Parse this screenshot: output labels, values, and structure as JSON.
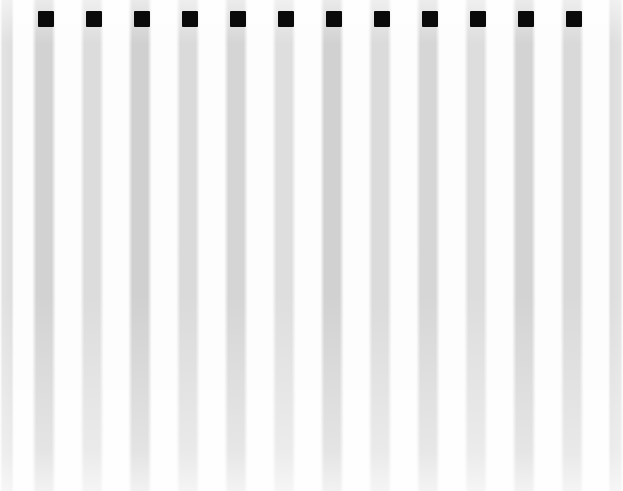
{
  "scene": {
    "title": "Vertical striped pattern with black square markers",
    "width": 623,
    "height": 491,
    "background_color": "#fdfdfd",
    "stripe_color": "#d4d4d4",
    "gap_color": "#ffffff",
    "marker_color": "#0a0a0a",
    "stripe_count": 13,
    "marker_count": 12,
    "stripe_pitch": 48,
    "stripe_width": 24,
    "marker_size": 16
  },
  "stripes": [
    {
      "name": "stripe-1",
      "x": 0,
      "width": 14,
      "shade": "#d8d8d8"
    },
    {
      "name": "stripe-2",
      "x": 32,
      "width": 24,
      "shade": "#d2d2d2"
    },
    {
      "name": "stripe-3",
      "x": 80,
      "width": 24,
      "shade": "#dcdcdc"
    },
    {
      "name": "stripe-4",
      "x": 128,
      "width": 24,
      "shade": "#d0d0d0"
    },
    {
      "name": "stripe-5",
      "x": 176,
      "width": 24,
      "shade": "#dadada"
    },
    {
      "name": "stripe-6",
      "x": 224,
      "width": 24,
      "shade": "#d5d5d5"
    },
    {
      "name": "stripe-7",
      "x": 272,
      "width": 24,
      "shade": "#dedede"
    },
    {
      "name": "stripe-8",
      "x": 320,
      "width": 24,
      "shade": "#d1d1d1"
    },
    {
      "name": "stripe-9",
      "x": 368,
      "width": 24,
      "shade": "#dbdbdb"
    },
    {
      "name": "stripe-10",
      "x": 416,
      "width": 24,
      "shade": "#d6d6d6"
    },
    {
      "name": "stripe-11",
      "x": 464,
      "width": 24,
      "shade": "#dddddd"
    },
    {
      "name": "stripe-12",
      "x": 512,
      "width": 24,
      "shade": "#d3d3d3"
    },
    {
      "name": "stripe-13",
      "x": 560,
      "width": 24,
      "shade": "#d9d9d9"
    },
    {
      "name": "stripe-14",
      "x": 608,
      "width": 15,
      "shade": "#d7d7d7"
    }
  ],
  "markers": [
    {
      "name": "marker-1",
      "x": 38,
      "y": 11,
      "w": 16,
      "h": 16
    },
    {
      "name": "marker-2",
      "x": 86,
      "y": 11,
      "w": 16,
      "h": 16
    },
    {
      "name": "marker-3",
      "x": 134,
      "y": 11,
      "w": 16,
      "h": 16
    },
    {
      "name": "marker-4",
      "x": 182,
      "y": 11,
      "w": 16,
      "h": 16
    },
    {
      "name": "marker-5",
      "x": 230,
      "y": 11,
      "w": 16,
      "h": 16
    },
    {
      "name": "marker-6",
      "x": 278,
      "y": 11,
      "w": 16,
      "h": 16
    },
    {
      "name": "marker-7",
      "x": 326,
      "y": 11,
      "w": 16,
      "h": 16
    },
    {
      "name": "marker-8",
      "x": 374,
      "y": 11,
      "w": 16,
      "h": 16
    },
    {
      "name": "marker-9",
      "x": 422,
      "y": 11,
      "w": 16,
      "h": 16
    },
    {
      "name": "marker-10",
      "x": 470,
      "y": 11,
      "w": 16,
      "h": 16
    },
    {
      "name": "marker-11",
      "x": 518,
      "y": 11,
      "w": 16,
      "h": 16
    },
    {
      "name": "marker-12",
      "x": 566,
      "y": 11,
      "w": 16,
      "h": 16
    }
  ]
}
